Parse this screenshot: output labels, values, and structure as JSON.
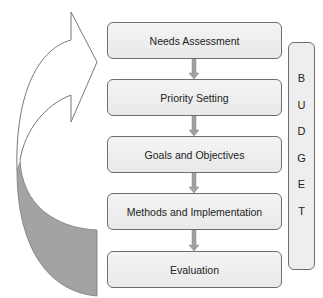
{
  "diagram": {
    "steps": [
      {
        "label": "Needs Assessment"
      },
      {
        "label": "Priority Setting"
      },
      {
        "label": "Goals and Objectives"
      },
      {
        "label": "Methods and Implementation"
      },
      {
        "label": "Evaluation"
      }
    ],
    "budget": {
      "letters": [
        "B",
        "U",
        "D",
        "G",
        "E",
        "T"
      ]
    },
    "connector_color": "#999999",
    "cycle_arrow_fill": "#a3a3a3"
  }
}
